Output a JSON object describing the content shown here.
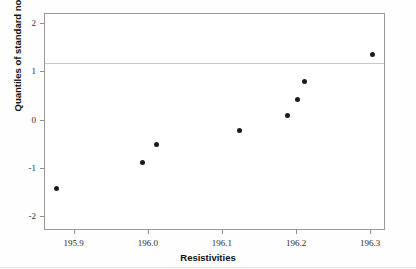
{
  "chart_data": {
    "type": "scatter",
    "title": "",
    "xlabel": "Resistivities",
    "ylabel": "Quantiles of standard normal",
    "xlim": [
      195.86,
      196.32
    ],
    "ylim": [
      -2.29,
      2.21
    ],
    "grid": false,
    "legend": null,
    "xticks": [
      195.9,
      196.0,
      196.1,
      196.2,
      196.3
    ],
    "xticklabels": [
      "195.9",
      "196.0",
      "196.1",
      "196.2",
      "196.3"
    ],
    "yticks": [
      2,
      1,
      0,
      -1,
      -2
    ],
    "yticklabels": [
      "2",
      "1",
      "0",
      "-1",
      "-2"
    ],
    "annotations": [
      {
        "type": "hline",
        "y": 1.2,
        "color": "#c9c9c9"
      }
    ],
    "marker": {
      "shape": "circle",
      "color": "#1b1b1b",
      "size": 5
    },
    "x": [
      195.876,
      195.992,
      196.01,
      196.122,
      196.187,
      196.2,
      196.21,
      196.302
    ],
    "y": [
      -1.4,
      -0.86,
      -0.5,
      -0.2,
      0.11,
      0.44,
      0.8,
      1.36
    ],
    "points": [
      {
        "x": 195.876,
        "y": -1.4
      },
      {
        "x": 195.992,
        "y": -0.86
      },
      {
        "x": 196.01,
        "y": -0.5
      },
      {
        "x": 196.122,
        "y": -0.2
      },
      {
        "x": 196.187,
        "y": 0.11
      },
      {
        "x": 196.2,
        "y": 0.44
      },
      {
        "x": 196.21,
        "y": 0.8
      },
      {
        "x": 196.302,
        "y": 1.36
      }
    ]
  }
}
